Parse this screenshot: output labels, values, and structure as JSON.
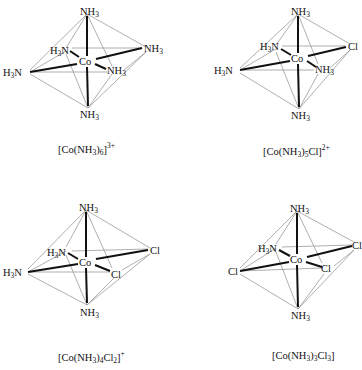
{
  "figure": {
    "complexes": [
      {
        "id": "hexaammine",
        "formula_parts": {
          "pre": "[Co(NH",
          "sub1": "3",
          "mid": ")",
          "sub2": "6",
          "post": "]",
          "charge": "3+"
        },
        "formula_text": "[Co(NH3)6]3+",
        "center": "Co",
        "ligands": {
          "top": "NH3",
          "bottom": "NH3",
          "left": "H3N",
          "back": "H3N",
          "right": "NH3",
          "front": "NH3"
        }
      },
      {
        "id": "pentaamminechloro",
        "formula_parts": {
          "pre": "[Co(NH",
          "sub1": "3",
          "mid": ")",
          "sub2": "5",
          "post": "Cl]",
          "charge": "2+"
        },
        "formula_text": "[Co(NH3)5Cl]2+",
        "center": "Co",
        "ligands": {
          "top": "NH3",
          "bottom": "NH3",
          "left": "H3N",
          "back": "H3N",
          "right": "Cl",
          "front": "NH3"
        }
      },
      {
        "id": "tetraamminedichloro",
        "formula_parts": {
          "pre": "[Co(NH",
          "sub1": "3",
          "mid": ")",
          "sub2": "4",
          "post": "Cl",
          "sub3": "2",
          "post2": "]",
          "charge": "+"
        },
        "formula_text": "[Co(NH3)4Cl2]+",
        "center": "Co",
        "ligands": {
          "top": "NH3",
          "bottom": "NH3",
          "left": "H3N",
          "back": "H3N",
          "right": "Cl",
          "front": "Cl"
        }
      },
      {
        "id": "triamminetrichloro",
        "formula_parts": {
          "pre": "[Co(NH",
          "sub1": "3",
          "mid": ")",
          "sub2": "3",
          "post": "Cl",
          "sub3": "3",
          "post2": "]",
          "charge": ""
        },
        "formula_text": "[Co(NH3)3Cl3]",
        "center": "Co",
        "ligands": {
          "top": "NH3",
          "bottom": "NH3",
          "left": "Cl",
          "back": "H3N",
          "right": "Cl",
          "front": "Cl"
        }
      }
    ]
  }
}
